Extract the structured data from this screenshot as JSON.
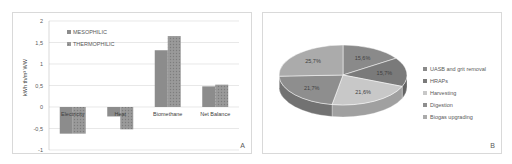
{
  "chart_data": [
    {
      "type": "bar",
      "panel_label": "A",
      "title": "",
      "xlabel": "",
      "ylabel": "kWh th/m³ WW",
      "ylim": [
        -1,
        2
      ],
      "yticks": [
        "2",
        "1,5",
        "1",
        "0,5",
        "0",
        "-0,5",
        "-1"
      ],
      "ytick_values": [
        2,
        1.5,
        1,
        0.5,
        0,
        -0.5,
        -1
      ],
      "grid": true,
      "legend_position": "upper-left",
      "categories": [
        "Electricity",
        "Heat",
        "Biomethane",
        "Net Balance"
      ],
      "series": [
        {
          "name": "MESOPHILIC",
          "color": "#8c8c8c",
          "pattern": "solid",
          "values": [
            -0.62,
            -0.22,
            1.32,
            0.48
          ]
        },
        {
          "name": "THERMOPHILIC",
          "color": "#9a9a9a",
          "pattern": "hatched",
          "values": [
            -0.62,
            -0.52,
            1.65,
            0.52
          ]
        }
      ]
    },
    {
      "type": "pie",
      "panel_label": "B",
      "title": "",
      "style": "3d",
      "legend_position": "right",
      "labels": [
        "UASB and grit removal",
        "HRAPs",
        "Harvesting",
        "Digestion",
        "Biogas upgrading"
      ],
      "values": [
        15.6,
        15.7,
        21.6,
        21.7,
        25.7
      ],
      "value_labels": [
        "15,6%",
        "15,7%",
        "21,6%",
        "21,7%",
        "25,7%"
      ],
      "colors": [
        "#8a8a8a",
        "#7a7a7a",
        "#c8c8c8",
        "#8e8e8e",
        "#ababab"
      ]
    }
  ]
}
